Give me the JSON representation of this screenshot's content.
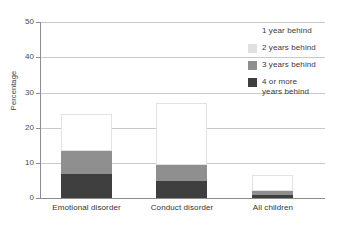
{
  "chart_data": {
    "type": "bar",
    "subtype": "stacked-bar",
    "title": "",
    "xlabel": "",
    "ylabel": "Percentage",
    "ylim": [
      0,
      50
    ],
    "yticks": [
      0,
      10,
      20,
      30,
      40,
      50
    ],
    "grid": true,
    "grid_axis": "y",
    "legend_position": "right",
    "categories": [
      "Emotional disorder",
      "Conduct disorder",
      "All children"
    ],
    "series": [
      {
        "name": "1 year behind",
        "color": "#ffffff",
        "values": [
          10.6,
          17.6,
          4.5
        ]
      },
      {
        "name": "2 years behind",
        "color": "#e0e0e0",
        "values": [
          0.0,
          0.0,
          0.0
        ]
      },
      {
        "name": "3 years behind",
        "color": "#8f8f8f",
        "values": [
          6.6,
          4.6,
          1.3
        ]
      },
      {
        "name": "4 or more years behind",
        "color": "#3f3f3f",
        "values": [
          6.8,
          4.8,
          0.8
        ]
      }
    ],
    "cumulative_tops": {
      "Emotional disorder": {
        "4_or_more": 6.8,
        "3_years": 13.4,
        "2_years": 13.4,
        "1_year": 24.0
      },
      "Conduct disorder": {
        "4_or_more": 4.8,
        "3_years": 9.4,
        "2_years": 9.4,
        "1_year": 27.0
      },
      "All children": {
        "4_or_more": 0.8,
        "3_years": 2.1,
        "2_years": 2.1,
        "1_year": 6.6
      }
    },
    "totals": [
      24.0,
      27.0,
      6.6
    ]
  },
  "axis": {
    "y_label": "Percentage",
    "y_ticks": [
      "50",
      "40",
      "30",
      "20",
      "10",
      "0"
    ]
  },
  "x_labels": [
    "Emotional disorder",
    "Conduct disorder",
    "All children"
  ],
  "legend": {
    "items": [
      {
        "label": "1 year behind",
        "line2": ""
      },
      {
        "label": "2 years behind",
        "line2": ""
      },
      {
        "label": "3 years behind",
        "line2": ""
      },
      {
        "label": "4 or more",
        "line2": "years behind"
      }
    ]
  },
  "colors": {
    "series1": "#ffffff",
    "series2": "#e0e0e0",
    "series3": "#8f8f8f",
    "series4": "#3f3f3f",
    "axis": "#8d8d8d",
    "grid": "#c9c9c9"
  }
}
